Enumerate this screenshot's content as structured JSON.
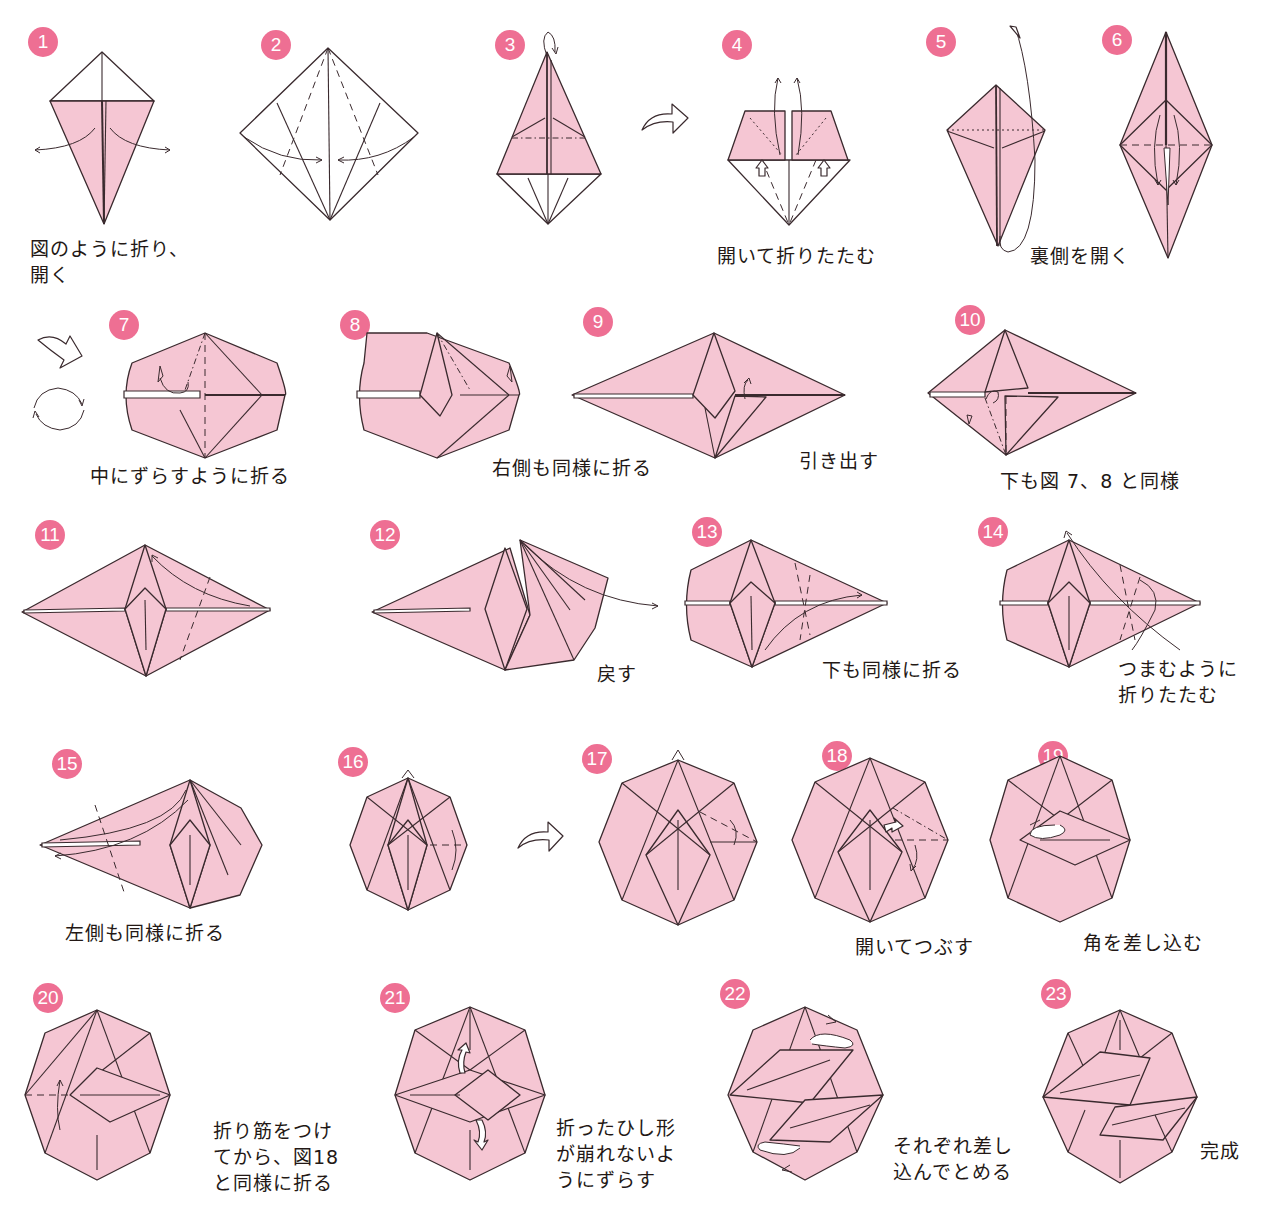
{
  "colors": {
    "paper": "#f5c6d3",
    "badge": "#ee6f93",
    "line": "#3a2a2e",
    "text": "#231815"
  },
  "steps": [
    {
      "number": "1",
      "caption": "図のように折り、\n開く"
    },
    {
      "number": "2",
      "caption": ""
    },
    {
      "number": "3",
      "caption": ""
    },
    {
      "number": "4",
      "caption": "開いて折りたたむ"
    },
    {
      "number": "5",
      "caption": "裏側を開く"
    },
    {
      "number": "6",
      "caption": ""
    },
    {
      "number": "7",
      "caption": "中にずらすように折る"
    },
    {
      "number": "8",
      "caption": "右側も同様に折る"
    },
    {
      "number": "9",
      "caption": "引き出す"
    },
    {
      "number": "10",
      "caption": "下も図 7、8 と同様"
    },
    {
      "number": "11",
      "caption": ""
    },
    {
      "number": "12",
      "caption": "戻す"
    },
    {
      "number": "13",
      "caption": "下も同様に折る"
    },
    {
      "number": "14",
      "caption": "つまむように\n折りたたむ"
    },
    {
      "number": "15",
      "caption": "左側も同様に折る"
    },
    {
      "number": "16",
      "caption": ""
    },
    {
      "number": "17",
      "caption": ""
    },
    {
      "number": "18",
      "caption": "開いてつぶす"
    },
    {
      "number": "19",
      "caption": "角を差し込む"
    },
    {
      "number": "20",
      "caption": "折り筋をつけ\nてから、図18\nと同様に折る"
    },
    {
      "number": "21",
      "caption": "折ったひし形\nが崩れないよ\nうにずらす"
    },
    {
      "number": "22",
      "caption": "それぞれ差し\n込んでとめる"
    },
    {
      "number": "23",
      "caption": "完成"
    }
  ],
  "symbols": {
    "turn_over": "turn-over-arrow",
    "rotate": "rotate-arrows",
    "push": "push-arrow"
  }
}
